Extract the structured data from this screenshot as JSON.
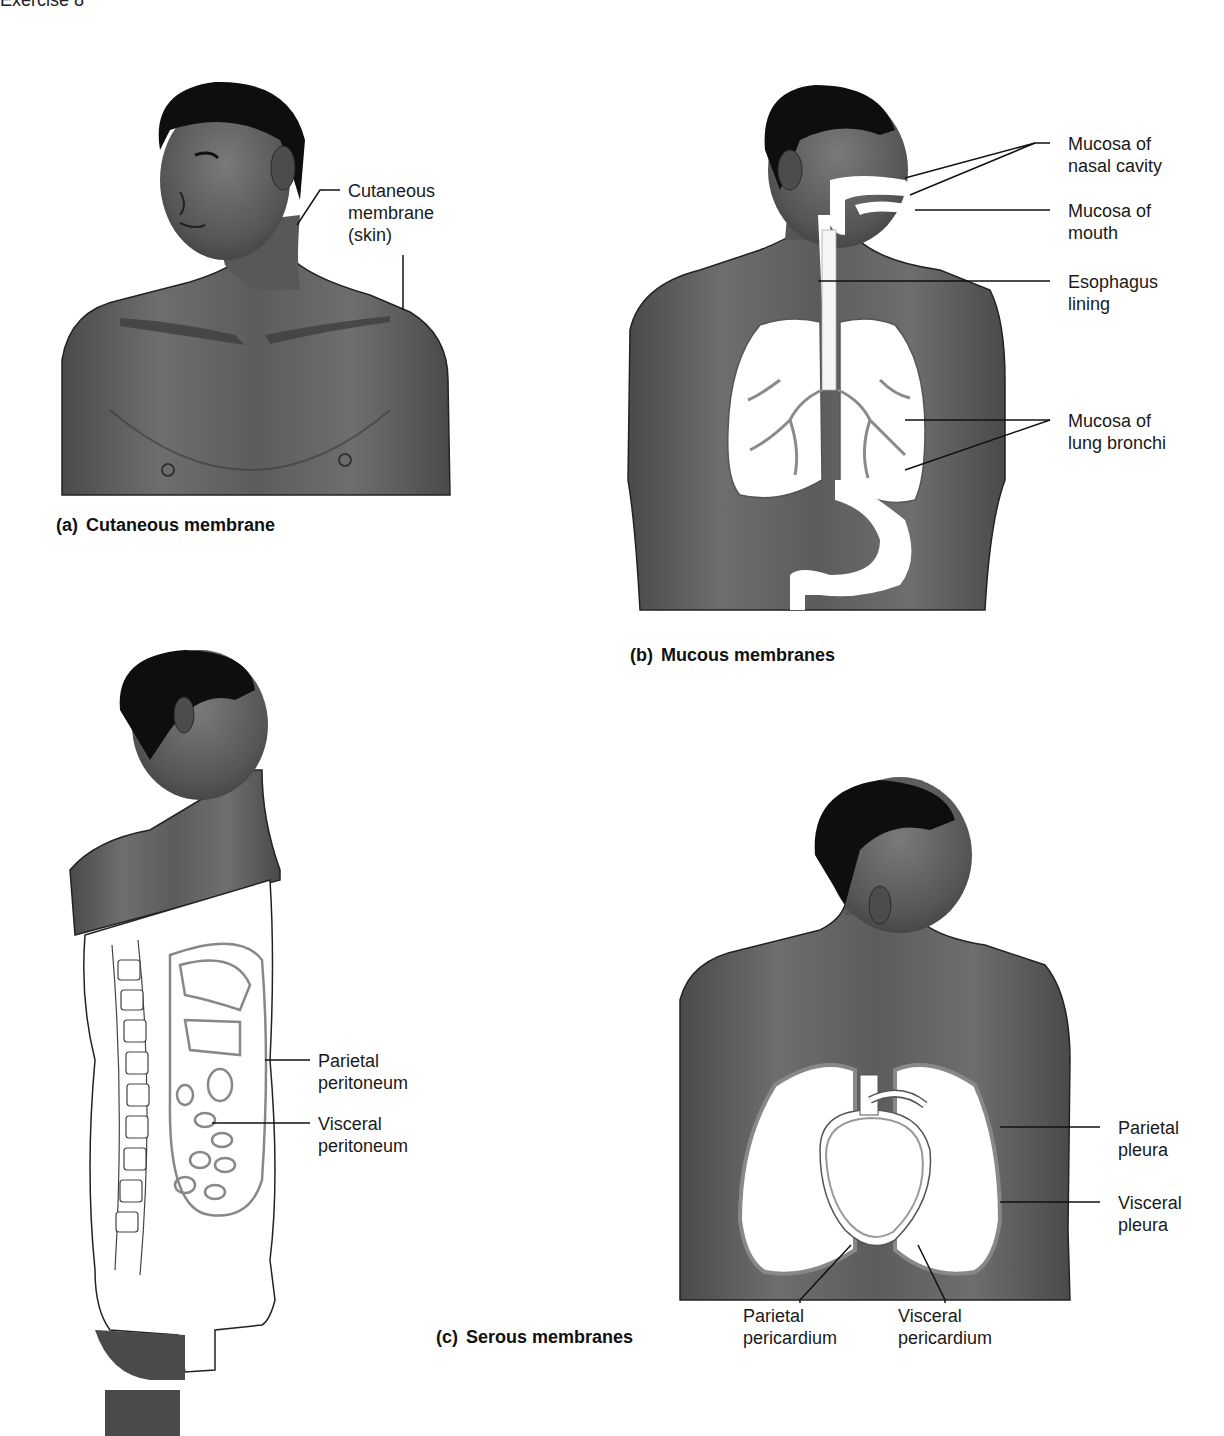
{
  "header": {
    "text": "Exercise 8"
  },
  "colors": {
    "skin_dark": "#3d3d3d",
    "skin_mid": "#6a6a6a",
    "skin_light": "#8a8a8a",
    "hair": "#0e0e0e",
    "membrane_fill": "#ffffff",
    "membrane_line": "#888888",
    "leader_line": "#111111"
  },
  "panels": {
    "a": {
      "tag": "(a)",
      "caption": "Cutaneous membrane",
      "labels": [
        {
          "id": "cutaneous-membrane",
          "text": "Cutaneous\nmembrane\n(skin)"
        }
      ]
    },
    "b": {
      "tag": "(b)",
      "caption": "Mucous membranes",
      "labels": [
        {
          "id": "mucosa-nasal-cavity",
          "text": "Mucosa of\nnasal cavity"
        },
        {
          "id": "mucosa-mouth",
          "text": "Mucosa of\nmouth"
        },
        {
          "id": "esophagus-lining",
          "text": "Esophagus\nlining"
        },
        {
          "id": "mucosa-lung-bronchi",
          "text": "Mucosa of\nlung bronchi"
        }
      ]
    },
    "c": {
      "tag": "(c)",
      "caption": "Serous membranes",
      "labels": [
        {
          "id": "parietal-peritoneum",
          "text": "Parietal\nperitoneum"
        },
        {
          "id": "visceral-peritoneum",
          "text": "Visceral\nperitoneum"
        },
        {
          "id": "parietal-pleura",
          "text": "Parietal\npleura"
        },
        {
          "id": "visceral-pleura",
          "text": "Visceral\npleura"
        },
        {
          "id": "parietal-pericardium",
          "text": "Parietal\npericardium"
        },
        {
          "id": "visceral-pericardium",
          "text": "Visceral\npericardium"
        }
      ]
    }
  }
}
